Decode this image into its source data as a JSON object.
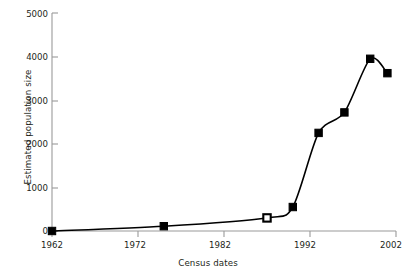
{
  "chart_data": {
    "type": "line",
    "title": "",
    "xlabel": "Census dates",
    "ylabel": "Estimated population size",
    "xlim": [
      1962,
      2003
    ],
    "ylim": [
      0,
      5000
    ],
    "xticks": [
      1962,
      1972,
      1982,
      1992,
      2002
    ],
    "xticklabels": [
      "1962",
      "1972",
      "1982",
      "1992",
      "2002"
    ],
    "yticks": [
      0,
      1000,
      2000,
      3000,
      4000,
      5000
    ],
    "yticklabels": [
      "0",
      "1000",
      "2000",
      "3000",
      "4000",
      "5000"
    ],
    "grid": false,
    "legend": null,
    "marker": "square",
    "series": [
      {
        "name": "Estimated population size",
        "x": [
          1962,
          1975,
          1987,
          1990,
          1993,
          1996,
          1999,
          2001
        ],
        "values": [
          0,
          110,
          300,
          550,
          2250,
          2720,
          3950,
          3620
        ],
        "marker_fill": [
          "filled",
          "filled",
          "open",
          "filled",
          "filled",
          "filled",
          "filled",
          "filled"
        ],
        "color": "#000000"
      }
    ]
  },
  "axes": {
    "line_color": "#9a9a9a",
    "text_color": "#231f20"
  }
}
